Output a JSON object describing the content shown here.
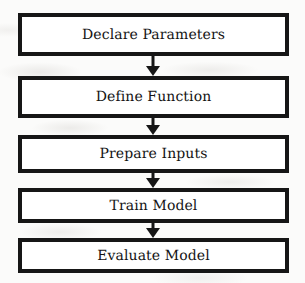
{
  "diagram": {
    "type": "flowchart",
    "orientation": "vertical",
    "title": "",
    "background_color": "#fbfbfa",
    "box_fill_color": "#ffffff",
    "box_border_color": "#161616",
    "text_color": "#131313",
    "arrow_color": "#161616",
    "nodes": [
      {
        "id": "declare-parameters",
        "label": "Declare Parameters"
      },
      {
        "id": "define-function",
        "label": "Define Function"
      },
      {
        "id": "prepare-inputs",
        "label": "Prepare Inputs"
      },
      {
        "id": "train-model",
        "label": "Train Model"
      },
      {
        "id": "evaluate-model",
        "label": "Evaluate Model"
      }
    ],
    "connectors": [
      {
        "id": "arrow-1",
        "from": "declare-parameters",
        "to": "define-function",
        "shape": "down-arrow"
      },
      {
        "id": "arrow-2",
        "from": "define-function",
        "to": "prepare-inputs",
        "shape": "down-arrow"
      },
      {
        "id": "arrow-3",
        "from": "prepare-inputs",
        "to": "train-model",
        "shape": "down-arrow"
      },
      {
        "id": "arrow-4",
        "from": "train-model",
        "to": "evaluate-model",
        "shape": "down-arrow"
      }
    ]
  }
}
